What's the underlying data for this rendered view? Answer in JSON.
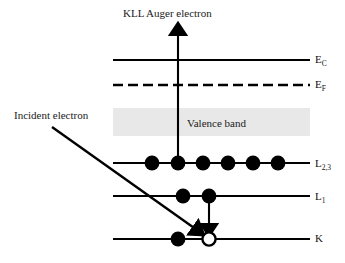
{
  "diagram": {
    "title": "KLL Auger electron",
    "type": "energy-level-diagram",
    "background_color": "#ffffff",
    "line_color": "#000000",
    "valence_band": {
      "label": "Valence band",
      "fill_color": "#e8e8e8",
      "x": 113,
      "y": 108,
      "width": 197,
      "height": 28
    },
    "annotations": [
      {
        "name": "incident-electron",
        "label": "Incident electron",
        "x": 14,
        "y": 110
      }
    ],
    "levels": [
      {
        "name": "conduction-band-edge",
        "label": "E",
        "sublabel": "C",
        "style": "solid",
        "y": 60,
        "x_start": 113,
        "x_end": 310,
        "electrons": []
      },
      {
        "name": "fermi-level",
        "label": "E",
        "sublabel": "F",
        "style": "dashed",
        "y": 85,
        "x_start": 113,
        "x_end": 310,
        "electrons": []
      },
      {
        "name": "l23-level",
        "label": "L",
        "sublabel": "2,3",
        "style": "solid",
        "y": 163,
        "x_start": 113,
        "x_end": 310,
        "electrons": [
          {
            "x": 152,
            "filled": true
          },
          {
            "x": 178,
            "filled": true
          },
          {
            "x": 203,
            "filled": true
          },
          {
            "x": 228,
            "filled": true
          },
          {
            "x": 253,
            "filled": true
          },
          {
            "x": 278,
            "filled": true
          }
        ]
      },
      {
        "name": "l1-level",
        "label": "L",
        "sublabel": "1",
        "style": "solid",
        "y": 196,
        "x_start": 113,
        "x_end": 310,
        "electrons": [
          {
            "x": 183,
            "filled": true
          },
          {
            "x": 209,
            "filled": true
          }
        ]
      },
      {
        "name": "k-level",
        "label": "K",
        "sublabel": "",
        "style": "solid",
        "y": 239,
        "x_start": 113,
        "x_end": 310,
        "electrons": [
          {
            "x": 178,
            "filled": true
          },
          {
            "x": 209,
            "filled": false
          }
        ]
      }
    ],
    "arrows": [
      {
        "name": "auger-electron-emission-arrow",
        "direction": "up",
        "x1": 178,
        "y1": 163,
        "x2": 178,
        "y2": 27
      },
      {
        "name": "incident-electron-arrow",
        "direction": "down-right",
        "x1": 52,
        "y1": 127,
        "x2": 200,
        "y2": 232
      },
      {
        "name": "electron-relaxation-arrow",
        "direction": "down",
        "x1": 209,
        "y1": 196,
        "x2": 209,
        "y2": 231
      }
    ]
  }
}
